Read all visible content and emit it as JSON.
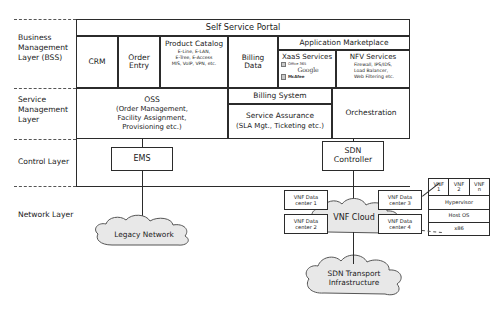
{
  "diagram": {
    "layers": [
      {
        "id": "bss",
        "label": "Business\nManagement\nLayer (BSS)"
      },
      {
        "id": "sml",
        "label": "Service\nManagement\nLayer"
      },
      {
        "id": "control",
        "label": "Control Layer"
      },
      {
        "id": "network",
        "label": "Network Layer"
      }
    ],
    "bss": {
      "portal": "Self Service Portal",
      "crm": "CRM",
      "order_entry": "Order\nEntry",
      "product_catalog": {
        "title": "Product Catalog",
        "detail": "E-Line, E-LAN,\nE-Tree, E-Access\nMIS, VoIP, VPN, etc."
      },
      "billing_data": "Billing\nData",
      "app_marketplace": "Application Marketplace",
      "xaas": {
        "title": "XaaS Services",
        "logos": [
          "Office 365",
          "Google",
          "McAfee"
        ]
      },
      "nfv": {
        "title": "NFV Services",
        "detail": "Firewall, IPS/IDS,\nLoad Balancer,\nWeb Filtering etc."
      }
    },
    "service_management": {
      "oss": {
        "title": "OSS",
        "detail": "(Order Management,\nFacility Assignment,\nProvisioning etc.)"
      },
      "billing_system": "Billing System",
      "service_assurance": {
        "title": "Service Assurance",
        "detail": "(SLA Mgt., Ticketing etc.)"
      },
      "orchestration": "Orchestration"
    },
    "control": {
      "ems": "EMS",
      "sdn_controller": "SDN\nController"
    },
    "network": {
      "legacy_network": "Legacy Network",
      "vnf_cloud": "VNF Cloud",
      "sdn_transport": "SDN Transport\nInfrastructure",
      "data_centers": [
        "VNF Data\ncenter 1",
        "VNF Data\ncenter 2",
        "VNF Data\ncenter 3",
        "VNF Data\ncenter 4"
      ],
      "vnf_stack": {
        "vnfs": [
          "VNF\n1",
          "VNF\n2",
          "VNF\nn"
        ],
        "hypervisor": "Hypervisor",
        "host_os": "Host OS",
        "hardware": "x86"
      }
    },
    "colors": {
      "line": "#2b2b2b",
      "dashed": "#555555",
      "cloud_fill": "#e8e8e8",
      "cloud_stroke": "#555555",
      "background": "#ffffff"
    }
  }
}
